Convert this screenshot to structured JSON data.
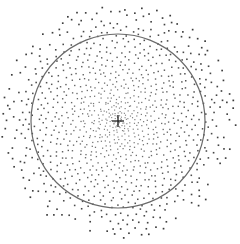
{
  "figure": {
    "description": "Stippled point distribution with density decreasing radially outward, a reference circle, and a center cross marker",
    "width": 240,
    "height": 244,
    "background": "#ffffff"
  },
  "center": {
    "x": 118,
    "y": 121
  },
  "circle": {
    "radius": 87,
    "stroke": "#6a6a6a",
    "stroke_width": 1.2
  },
  "cross": {
    "arm_length": 6,
    "stroke": "#222222",
    "stroke_width": 1.3
  },
  "points": {
    "count": 1150,
    "max_radius": 118,
    "density_exponent": 1.35,
    "golden_angle_deg": 137.508,
    "inner_color": "#8a8a8a",
    "outer_color": "#3a3a3a",
    "inner_size": 1.1,
    "outer_size": 1.7,
    "jitter": 1.6,
    "clip_box": {
      "x": 0,
      "y": 0,
      "w": 240,
      "h": 244
    }
  }
}
